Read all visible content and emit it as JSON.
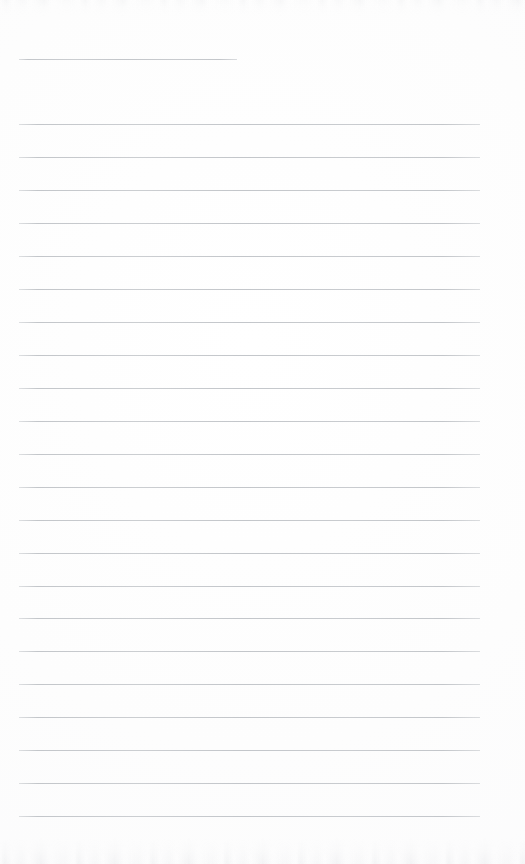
{
  "document": {
    "kind": "scanned-lined-paper",
    "title": "Blank ruled notepad page",
    "content_text": "",
    "page_width": 525,
    "page_height": 864,
    "background_color": "#fdfdfd",
    "rule_color": "#c3c6ca",
    "rule_thickness_px": 1
  },
  "layout": {
    "left_margin_x": 19,
    "right_margin_x": 480,
    "rule_length": 461,
    "first_rule_y": 124,
    "rule_spacing": 32.95,
    "rule_count": 22,
    "bottom_blank_band_y": 820,
    "right_blank_band_x": 480
  },
  "header_rule": {
    "label": "title-rule",
    "x": 19,
    "y": 59,
    "width": 218
  },
  "rules": [
    {
      "index": 1,
      "y": 124.0,
      "x": 19,
      "width": 461
    },
    {
      "index": 2,
      "y": 157.0,
      "x": 19,
      "width": 461
    },
    {
      "index": 3,
      "y": 190.0,
      "x": 19,
      "width": 461
    },
    {
      "index": 4,
      "y": 222.9,
      "x": 19,
      "width": 461
    },
    {
      "index": 5,
      "y": 255.9,
      "x": 19,
      "width": 461
    },
    {
      "index": 6,
      "y": 288.8,
      "x": 19,
      "width": 461
    },
    {
      "index": 7,
      "y": 321.8,
      "x": 19,
      "width": 461
    },
    {
      "index": 8,
      "y": 354.7,
      "x": 19,
      "width": 461
    },
    {
      "index": 9,
      "y": 387.7,
      "x": 19,
      "width": 461
    },
    {
      "index": 10,
      "y": 420.7,
      "x": 19,
      "width": 461
    },
    {
      "index": 11,
      "y": 453.6,
      "x": 19,
      "width": 461
    },
    {
      "index": 12,
      "y": 486.6,
      "x": 19,
      "width": 461
    },
    {
      "index": 13,
      "y": 519.5,
      "x": 19,
      "width": 461
    },
    {
      "index": 14,
      "y": 552.5,
      "x": 19,
      "width": 461
    },
    {
      "index": 15,
      "y": 585.5,
      "x": 19,
      "width": 461
    },
    {
      "index": 16,
      "y": 618.4,
      "x": 19,
      "width": 461
    },
    {
      "index": 17,
      "y": 651.4,
      "x": 19,
      "width": 461
    },
    {
      "index": 18,
      "y": 684.3,
      "x": 19,
      "width": 461
    },
    {
      "index": 19,
      "y": 717.3,
      "x": 19,
      "width": 461
    },
    {
      "index": 20,
      "y": 750.3,
      "x": 19,
      "width": 461
    },
    {
      "index": 21,
      "y": 783.2,
      "x": 19,
      "width": 461
    },
    {
      "index": 22,
      "y": 816.2,
      "x": 19,
      "width": 461
    }
  ],
  "annotations": {
    "scan_noise_top": true,
    "scan_noise_bottom": true,
    "handwriting_present": false,
    "printed_text_present": false
  }
}
